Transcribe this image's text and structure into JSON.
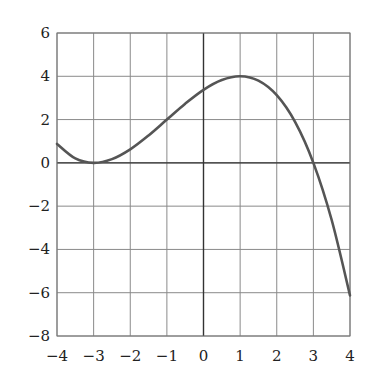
{
  "chart_data": {
    "type": "line",
    "title": "",
    "xlabel": "",
    "ylabel": "",
    "xlim": [
      -4,
      4
    ],
    "ylim": [
      -8,
      6
    ],
    "grid": true,
    "x_ticks": [
      -4,
      -3,
      -2,
      -1,
      0,
      1,
      2,
      3,
      4
    ],
    "x_tick_labels": [
      "−4",
      "−3",
      "−2",
      "−1",
      "0",
      "1",
      "2",
      "3",
      "4"
    ],
    "y_ticks": [
      6,
      4,
      2,
      0,
      -2,
      -4,
      -6,
      -8
    ],
    "y_tick_labels": [
      "6",
      "4",
      "2",
      "0",
      "−2",
      "−4",
      "−6",
      "−8"
    ],
    "legend": null,
    "series": [
      {
        "name": "f(x)",
        "color": "#555555",
        "x": [
          -4,
          -3.5,
          -3,
          -2.5,
          -2,
          -1.5,
          -1,
          -0.5,
          0,
          0.5,
          1,
          1.5,
          2,
          2.5,
          3,
          3.5,
          4
        ],
        "y": [
          0.875,
          0.203,
          0,
          0.172,
          0.625,
          1.266,
          2.0,
          2.734,
          3.375,
          3.828,
          4.0,
          3.797,
          3.125,
          1.891,
          0,
          -2.641,
          -6.125
        ]
      }
    ],
    "annotations": [
      "Local minimum at (-3, 0)",
      "Local maximum at (1, 4)",
      "Root at x = 3"
    ]
  }
}
